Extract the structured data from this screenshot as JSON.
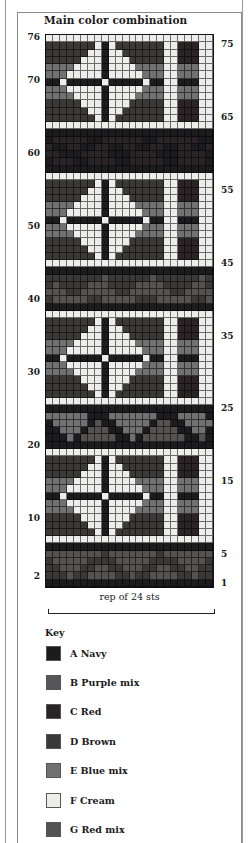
{
  "title": "Main color combination",
  "colors": {
    "A": {
      "letter": "A",
      "name": "Navy",
      "hex": "#1c1c1e"
    },
    "B": {
      "letter": "B",
      "name": "Purple mix",
      "hex": "#575559"
    },
    "C": {
      "letter": "C",
      "name": "Red",
      "hex": "#2a2426"
    },
    "D": {
      "letter": "D",
      "name": "Brown",
      "hex": "#3b3838"
    },
    "E": {
      "letter": "E",
      "name": "Blue mix",
      "hex": "#717171"
    },
    "F": {
      "letter": "F",
      "name": "Cream",
      "hex": "#ededeb"
    },
    "G": {
      "letter": "G",
      "name": "Red mix",
      "hex": "#555252"
    }
  },
  "chart": {
    "rows": 76,
    "stitches": 24,
    "rep_label": "rep of 24 sts",
    "left_labels": [
      {
        "text": "76",
        "row": 76
      },
      {
        "text": "70",
        "row": 70
      },
      {
        "text": "60",
        "row": 60
      },
      {
        "text": "50",
        "row": 50
      },
      {
        "text": "40",
        "row": 40
      },
      {
        "text": "30",
        "row": 30
      },
      {
        "text": "20",
        "row": 20
      },
      {
        "text": "10",
        "row": 10
      },
      {
        "text": "2",
        "row": 2
      }
    ],
    "right_labels": [
      {
        "text": "75",
        "row": 75
      },
      {
        "text": "65",
        "row": 65
      },
      {
        "text": "55",
        "row": 55
      },
      {
        "text": "45",
        "row": 45
      },
      {
        "text": "35",
        "row": 35
      },
      {
        "text": "25",
        "row": 25
      },
      {
        "text": "15",
        "row": 15
      },
      {
        "text": "5",
        "row": 5
      },
      {
        "text": "1",
        "row": 1
      }
    ],
    "grid_rows_top_to_bottom": [
      "FFFFFFFFFFFFFFFFFFFFFFFF",
      "DDDDDDDFAFDDDDDDDFFCCCFF",
      "DDDDDDFFAFFDDDDDDFFCCCFF",
      "DDDDDFFFAFFFDDDDDFFCCCFF",
      "EEEEFFFFAFFFFEEEEFFEEEFF",
      "EEEFFFFFAFFFFFEEEFFEEEFF",
      "AAFAAAAAFAAAAAFAAFFAAAFF",
      "EEEFFFFFAFFFFFEEEFFEEEFF",
      "EEEEFFFFAFFFFEEEEFFEEEFF",
      "DDDDDFFFAFFFDDDDDFFCCCFF",
      "DDDDDDFFAFFDDDDDDFFCCCFF",
      "DDDDDDDFAFDDDDDDDFFCCCFF",
      "FFFFFFFFFFFFFFFFFFFFFFFF",
      "AAAAAAAAAAAAAAAAAAAAAAAA",
      "ACCCCCAACCCCCCAACCCCCCAA",
      "CAACCAACCAACCAACCAACCAAC",
      "CCAAACCCCAAACCCCAAACCCCA",
      "ACCCAACCCCAACCCCCAACCCCA",
      "AAAAAAAAAAAAAAAAAAAAAAAA",
      "FFFFFFFFFFFFFFFFFFFFFFFF",
      "DDDDDDDFAFDDDDDDDFFCCCFF",
      "DDDDDDFFAFFDDDDDDFFCCCFF",
      "DDDDDFFFAFFFDDDDDFFCCCFF",
      "EEEEFFFFAFFFFEEEEFFEEEFF",
      "EEEFFFFFAFFFFFEEEFFEEEFF",
      "AAFAAAAAFAAAAAFAAFFAAAFF",
      "EEEFFFFFAFFFFFEEEFFEEEFF",
      "EEEEFFFFAFFFFEEEEFFEEEFF",
      "DDDDDFFFAFFFDDDDDFFCCCFF",
      "DDDDDDFFAFFDDDDDDFFCCCFF",
      "DDDDDDDFAFDDDDDDDFFCCCFF",
      "FFFFFFFFFFFFFFFFFFFFFFFF",
      "AAAAAAAAAAAAAAAAAAAAAAAA",
      "DDDDDDDDGDDDDDDGDDDDDDGD",
      "DGDDDDGGGDDDDGGGGDDDDGGD",
      "GGGDDGGGGGDDGGGGGGDDGGGG",
      "DGGGGGDDGGGGGDDDGGGGGDDG",
      "AAAAAAAAAAAAAAAAAAAAAAAA",
      "FFFFFFFFFFFFFFFFFFFFFFFF",
      "DDDDDDDFAFDDDDDDDFFCCCFF",
      "DDDDDDFFAFFDDDDDDFFCCCFF",
      "DDDDDFFFAFFFDDDDDFFCCCFF",
      "EEEEFFFFAFFFFEEEEFFEEEFF",
      "EEEFFFFFAFFFFFEEEFFEEEFF",
      "AAFAAAAAFAAAAAFAAFFAAAFF",
      "EEEFFFFFAFFFFFEEEFFEEEFF",
      "EEEEFFFFAFFFFEEEEFFEEEFF",
      "DDDDDFFFAFFFDDDDDFFCCCFF",
      "DDDDDDFFAFFDDDDDDFFCCCFF",
      "DDDDDDDFAFDDDDDDDFFCCCFF",
      "FFFFFFFFFFFFFFFFFFFFFFFF",
      "AAAAAAAAAAAAAAAAAAAAAAAA",
      "EEEEEEAAAEEEEEEEAAAEEEEA",
      "AEEEEEAGAAEEEEEAGGAAEEEE",
      "AAEEEAGGGAAEEEAGGGGAAEEA",
      "AAAEAGGGGGAAEAGGGGGGAAGA",
      "AAAAAAAAAAAAAAAAAAAAAAAA",
      "FFFFFFFFFFFFFFFFFFFFFFFF",
      "DDDDDDDFAFDDDDDDDFFCCCFF",
      "DDDDDDFFAFFDDDDDDFFCCCFF",
      "DDDDDFFFAFFFDDDDDFFCCCFF",
      "EEEEFFFFAFFFFEEEEFFEEEFF",
      "EEEFFFFFAFFFFFEEEFFEEEFF",
      "AAFAAAAAFAAAAAFAAFFAAAFF",
      "EEEFFFFFAFFFFFEEEFFEEEFF",
      "EEEEFFFFAFFFFEEEEFFEEEFF",
      "DDDDDFFFAFFFDDDDDFFCCCFF",
      "DDDDDDFFAFFDDDDDDFFCCCFF",
      "DDDDDDDFAFDDDDDDDFFCCCFF",
      "FFFFFFFFFFFFFFFFFFFFFFFF",
      "AAAAAAAAAAAAAAAAAAAAAAAA",
      "GGGGGGGGDGGGGGGGDGGGGGGG",
      "DGGGGGDDDDGGGGGDDDDGGGGD",
      "DDGGGDDGGDDGGGDDGGDDGGDD",
      "DDDGDDGGGGDDGDDGGGGDDGDD",
      "AAAAAAAAAAAAAAAAAAAAAAAA"
    ]
  },
  "key": {
    "title": "Key",
    "items": [
      {
        "letter": "A",
        "name": "Navy",
        "label": "A  Navy",
        "hex": "#1c1c1e"
      },
      {
        "letter": "B",
        "name": "Purple mix",
        "label": "B  Purple mix",
        "hex": "#575559"
      },
      {
        "letter": "C",
        "name": "Red",
        "label": "C  Red",
        "hex": "#2a2426"
      },
      {
        "letter": "D",
        "name": "Brown",
        "label": "D  Brown",
        "hex": "#3b3838"
      },
      {
        "letter": "E",
        "name": "Blue mix",
        "label": "E  Blue mix",
        "hex": "#717171"
      },
      {
        "letter": "F",
        "name": "Cream",
        "label": "F  Cream",
        "hex": "#ededeb"
      },
      {
        "letter": "G",
        "name": "Red mix",
        "label": "G  Red mix",
        "hex": "#555252"
      }
    ]
  },
  "chart_data": {
    "type": "heatmap",
    "title": "Main color combination",
    "xlabel": "rep of 24 sts",
    "ylabel": "Rows",
    "x_range": [
      1,
      24
    ],
    "y_range": [
      1,
      76
    ],
    "left_ticks": [
      2,
      10,
      20,
      30,
      40,
      50,
      60,
      70,
      76
    ],
    "right_ticks": [
      1,
      5,
      15,
      25,
      35,
      45,
      55,
      65,
      75
    ],
    "legend": [
      "A Navy",
      "B Purple mix",
      "C Red",
      "D Brown",
      "E Blue mix",
      "F Cream",
      "G Red mix"
    ],
    "legend_position": "bottom",
    "structure": [
      {
        "rows": "1-6",
        "content": "triangle border band (dark)"
      },
      {
        "rows": "7",
        "content": "cream"
      },
      {
        "rows": "8-18",
        "content": "diamond-cross motif with vertical bars"
      },
      {
        "rows": "19",
        "content": "cream"
      },
      {
        "rows": "20-25",
        "content": "triangle border band"
      },
      {
        "rows": "26",
        "content": "cream"
      },
      {
        "rows": "27-37",
        "content": "diamond-cross motif with vertical bars"
      },
      {
        "rows": "38",
        "content": "cream"
      },
      {
        "rows": "39-44",
        "content": "dark border band"
      },
      {
        "rows": "45",
        "content": "cream"
      },
      {
        "rows": "46-56",
        "content": "diamond-cross motif with vertical bars"
      },
      {
        "rows": "57",
        "content": "cream"
      },
      {
        "rows": "58-63",
        "content": "dark border band"
      },
      {
        "rows": "64",
        "content": "cream"
      },
      {
        "rows": "65-75",
        "content": "diamond-cross motif with vertical bars"
      },
      {
        "rows": "76",
        "content": "cream"
      }
    ]
  }
}
